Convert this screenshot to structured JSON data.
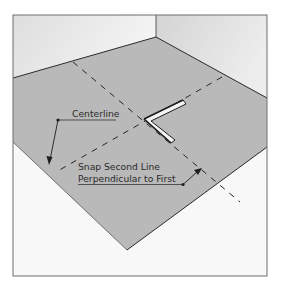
{
  "diagram": {
    "labels": {
      "centerline": "Centerline",
      "snap_line_1": "Snap Second Line",
      "snap_line_2": "Perpendicular to First"
    },
    "colors": {
      "floor": "#b7b7b7",
      "wall_left": "#e6e6e6",
      "wall_right": "#dcdcdc",
      "background": "#f7f7f7",
      "frame": "#6e6e6e",
      "line": "#262626"
    }
  }
}
